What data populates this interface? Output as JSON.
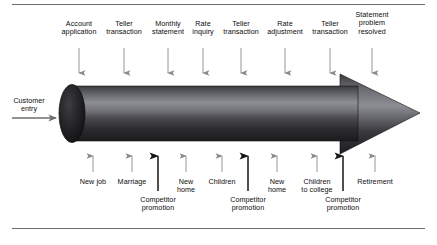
{
  "figure": {
    "frame": {
      "top_rule": true,
      "bottom_rule": true
    },
    "colors": {
      "rule": "#6b6b6b",
      "text": "#0d0d0d",
      "tube_dark": "#1d1d1d",
      "tube_mid": "#55555a",
      "tube_light": "#8f9095",
      "arrow_thin": "#8a8a8a",
      "arrow_bold": "#1a1a1a",
      "entry_arrow": "#6e6e6e"
    }
  },
  "entry": {
    "label": "Customer\nentry",
    "label_x": 29,
    "label_y": 97,
    "arrow_name": "customer-entry-arrow",
    "arrow": {
      "x1": 12,
      "y1": 118,
      "x2": 58,
      "y2": 118
    }
  },
  "pipeline": {
    "name": "customer-lifecycle-arrow",
    "body_left": 72,
    "body_right": 358,
    "body_top": 86,
    "body_bottom": 141,
    "head_tip_x": 420,
    "head_tip_y": 113,
    "head_top_y": 74,
    "head_bottom_y": 154,
    "cap_center_x": 72,
    "cap_rx": 13,
    "cap_ry": 29
  },
  "top_events": [
    {
      "label": "Account\napplication",
      "x": 79,
      "label_y": 20,
      "arrow_top": 48,
      "arrow_bottom": 80
    },
    {
      "label": "Teller\ntransaction",
      "x": 124,
      "label_y": 20,
      "arrow_top": 48,
      "arrow_bottom": 80
    },
    {
      "label": "Monthly\nstatement",
      "x": 168,
      "label_y": 20,
      "arrow_top": 48,
      "arrow_bottom": 80
    },
    {
      "label": "Rate\ninquiry",
      "x": 203,
      "label_y": 20,
      "arrow_top": 48,
      "arrow_bottom": 80
    },
    {
      "label": "Teller\ntransaction",
      "x": 241,
      "label_y": 20,
      "arrow_top": 48,
      "arrow_bottom": 80
    },
    {
      "label": "Rate\nadjustment",
      "x": 285,
      "label_y": 20,
      "arrow_top": 48,
      "arrow_bottom": 80
    },
    {
      "label": "Teller\ntransaction",
      "x": 330,
      "label_y": 20,
      "arrow_top": 48,
      "arrow_bottom": 80
    },
    {
      "label": "Statement\nproblem\nresolved",
      "x": 372,
      "label_y": 11,
      "arrow_top": 48,
      "arrow_bottom": 80
    }
  ],
  "bottom_events": [
    {
      "label": "New job",
      "x": 93,
      "label_y": 178,
      "arrow_bottom": 172,
      "arrow_top": 149,
      "bold": false
    },
    {
      "label": "Marriage",
      "x": 132,
      "label_y": 178,
      "arrow_bottom": 172,
      "arrow_top": 149,
      "bold": false
    },
    {
      "label": "Competitor\npromotion",
      "x": 158,
      "label_y": 196,
      "arrow_bottom": 191,
      "arrow_top": 147,
      "bold": true
    },
    {
      "label": "New\nhome",
      "x": 186,
      "label_y": 178,
      "arrow_bottom": 172,
      "arrow_top": 149,
      "bold": false
    },
    {
      "label": "Children",
      "x": 222,
      "label_y": 178,
      "arrow_bottom": 172,
      "arrow_top": 149,
      "bold": false
    },
    {
      "label": "Competitor\npromotion",
      "x": 248,
      "label_y": 196,
      "arrow_bottom": 191,
      "arrow_top": 147,
      "bold": true
    },
    {
      "label": "New\nhome",
      "x": 277,
      "label_y": 178,
      "arrow_bottom": 172,
      "arrow_top": 149,
      "bold": false
    },
    {
      "label": "Children\nto college",
      "x": 317,
      "label_y": 178,
      "arrow_bottom": 172,
      "arrow_top": 149,
      "bold": false
    },
    {
      "label": "Competitor\npromotion",
      "x": 343,
      "label_y": 196,
      "arrow_bottom": 191,
      "arrow_top": 147,
      "bold": true
    },
    {
      "label": "Retirement",
      "x": 375,
      "label_y": 178,
      "arrow_bottom": 172,
      "arrow_top": 149,
      "bold": false
    }
  ]
}
